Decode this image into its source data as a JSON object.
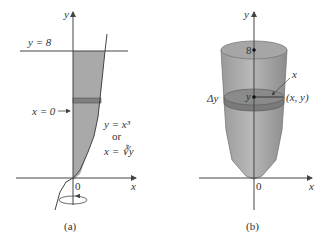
{
  "panel_a": {
    "caption": "(a)",
    "axis_y": "y",
    "axis_x": "x",
    "origin": "0",
    "line_label": "y = 8",
    "boundary_label": "x = 0",
    "curve_label_1": "y = x³",
    "curve_label_or": "or",
    "curve_label_2": "x = ∛y"
  },
  "panel_b": {
    "caption": "(b)",
    "axis_y": "y",
    "axis_x": "x",
    "origin": "0",
    "top_label": "8",
    "slice_thickness": "Δy",
    "slice_center": "y",
    "radius_label": "x",
    "point_label": "(x, y)"
  },
  "colors": {
    "shade": "#a9a9a9",
    "slice": "#7f7f7f",
    "axis": "#444444"
  }
}
